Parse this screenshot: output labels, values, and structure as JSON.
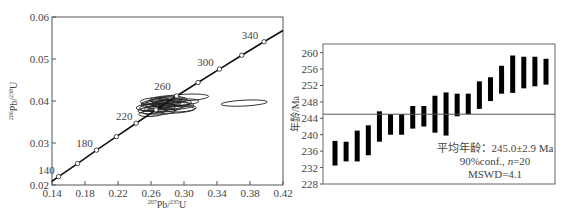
{
  "chart_data": [
    {
      "type": "scatter",
      "subtype": "concordia_diagram",
      "xlabel": "207Pb/235U",
      "ylabel": "206Pb/238U",
      "xlim": [
        0.14,
        0.42
      ],
      "ylim": [
        0.02,
        0.06
      ],
      "x_ticks": [
        "0.14",
        "0.18",
        "0.22",
        "0.26",
        "0.30",
        "0.34",
        "0.38",
        "0.42"
      ],
      "y_ticks": [
        "0.02",
        "0.03",
        "0.04",
        "0.05",
        "0.06"
      ],
      "concordia_age_labels": [
        "140",
        "180",
        "220",
        "260",
        "300",
        "340"
      ],
      "concordia_points": [
        {
          "age": 140,
          "x": 0.148,
          "y": 0.022
        },
        {
          "age": 160,
          "x": 0.171,
          "y": 0.0251
        },
        {
          "age": 180,
          "x": 0.194,
          "y": 0.0283
        },
        {
          "age": 200,
          "x": 0.218,
          "y": 0.0315
        },
        {
          "age": 220,
          "x": 0.242,
          "y": 0.0347
        },
        {
          "age": 240,
          "x": 0.266,
          "y": 0.0379
        },
        {
          "age": 260,
          "x": 0.291,
          "y": 0.0412
        },
        {
          "age": 280,
          "x": 0.317,
          "y": 0.0444
        },
        {
          "age": 300,
          "x": 0.343,
          "y": 0.0476
        },
        {
          "age": 320,
          "x": 0.37,
          "y": 0.0509
        },
        {
          "age": 340,
          "x": 0.397,
          "y": 0.0541
        }
      ],
      "error_ellipses": [
        {
          "cx": 0.262,
          "cy": 0.0378,
          "rx": 0.018,
          "ry": 0.0008
        },
        {
          "cx": 0.268,
          "cy": 0.0385,
          "rx": 0.022,
          "ry": 0.001
        },
        {
          "cx": 0.272,
          "cy": 0.0392,
          "rx": 0.024,
          "ry": 0.0009
        },
        {
          "cx": 0.276,
          "cy": 0.0398,
          "rx": 0.022,
          "ry": 0.0009
        },
        {
          "cx": 0.28,
          "cy": 0.039,
          "rx": 0.026,
          "ry": 0.001
        },
        {
          "cx": 0.27,
          "cy": 0.0375,
          "rx": 0.02,
          "ry": 0.0008
        },
        {
          "cx": 0.285,
          "cy": 0.0395,
          "rx": 0.024,
          "ry": 0.0009
        },
        {
          "cx": 0.29,
          "cy": 0.0388,
          "rx": 0.022,
          "ry": 0.0008
        },
        {
          "cx": 0.265,
          "cy": 0.04,
          "rx": 0.018,
          "ry": 0.0008
        },
        {
          "cx": 0.278,
          "cy": 0.0404,
          "rx": 0.02,
          "ry": 0.0008
        },
        {
          "cx": 0.295,
          "cy": 0.0382,
          "rx": 0.02,
          "ry": 0.0008
        },
        {
          "cx": 0.26,
          "cy": 0.037,
          "rx": 0.015,
          "ry": 0.0007
        },
        {
          "cx": 0.3,
          "cy": 0.0408,
          "rx": 0.03,
          "ry": 0.0008
        },
        {
          "cx": 0.288,
          "cy": 0.0379,
          "rx": 0.025,
          "ry": 0.0008
        },
        {
          "cx": 0.282,
          "cy": 0.0402,
          "rx": 0.022,
          "ry": 0.0008
        },
        {
          "cx": 0.275,
          "cy": 0.0383,
          "rx": 0.023,
          "ry": 0.0009
        },
        {
          "cx": 0.268,
          "cy": 0.0395,
          "rx": 0.02,
          "ry": 0.0008
        },
        {
          "cx": 0.292,
          "cy": 0.0397,
          "rx": 0.026,
          "ry": 0.0008
        },
        {
          "cx": 0.258,
          "cy": 0.0385,
          "rx": 0.016,
          "ry": 0.0008
        },
        {
          "cx": 0.373,
          "cy": 0.0395,
          "rx": 0.028,
          "ry": 0.0007
        }
      ]
    },
    {
      "type": "bar",
      "subtype": "weighted_mean_age_error_bars",
      "ylabel": "年龄/Ma",
      "ylim": [
        228,
        262
      ],
      "y_ticks": [
        "228",
        "232",
        "236",
        "240",
        "244",
        "248",
        "252",
        "256",
        "260"
      ],
      "mean_line": 245.0,
      "annotation": [
        "平均年龄：245.0±2.9 Ma",
        "90%conf., n=20",
        "MSWD=4.1"
      ],
      "series": [
        {
          "name": "age ranges",
          "low": [
            232.5,
            233.5,
            233.5,
            235.0,
            238.3,
            240.0,
            240.0,
            241.5,
            242.0,
            240.5,
            239.8,
            244.5,
            245.0,
            246.3,
            248.2,
            250.0,
            250.2,
            251.3,
            251.8,
            252.2
          ],
          "high": [
            238.5,
            238.3,
            241.0,
            242.3,
            245.7,
            245.0,
            245.0,
            247.0,
            247.0,
            249.5,
            250.3,
            250.0,
            250.0,
            253.0,
            254.0,
            256.8,
            259.3,
            259.0,
            259.0,
            258.5
          ]
        }
      ]
    }
  ],
  "labels": {
    "left_xlabel_sup": "207",
    "left_xlabel_main": "Pb/",
    "left_xlabel_sup2": "235",
    "left_xlabel_end": "U",
    "left_ylabel_sup": "206",
    "left_ylabel_main": "Pb/",
    "left_ylabel_sup2": "238",
    "left_ylabel_end": "U",
    "right_ylabel": "年龄/Ma",
    "annotation_line1": "平均年龄：245.0±2.9 Ma",
    "annotation_line2_a": "90%conf., ",
    "annotation_line2_n": "n",
    "annotation_line2_b": "=20",
    "annotation_line3": "MSWD=4.1"
  }
}
